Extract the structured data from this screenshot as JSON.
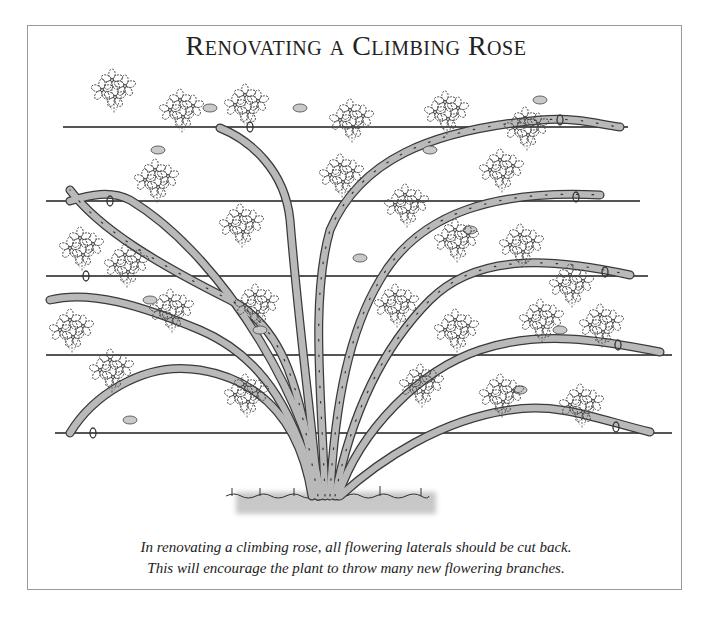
{
  "figure": {
    "title": "Renovating a Climbing Rose",
    "caption": {
      "line1": "In renovating a climbing rose, all flowering laterals should be cut back.",
      "line2": "This will encourage the plant to throw many new flowering branches."
    },
    "illustration": {
      "subject": "climbing-rose-trained-on-horizontal-wires",
      "wire_count": 5,
      "colors": {
        "stem_fill": "#b9b9b9",
        "stem_outline": "#3a3a3a",
        "wire": "#555555",
        "ground": "#c8c8c8",
        "flower_outline": "#444444"
      }
    }
  }
}
